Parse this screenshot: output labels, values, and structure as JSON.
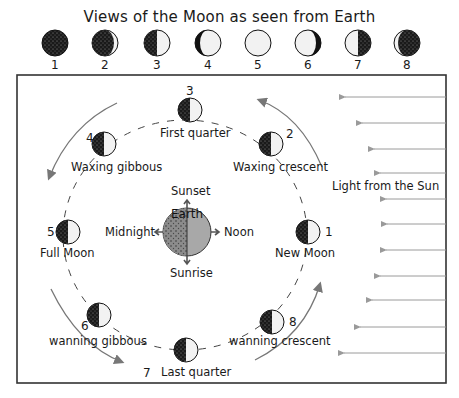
{
  "title": "Views of the Moon as seen from Earth",
  "views": [
    {
      "n": "1",
      "phase": "new"
    },
    {
      "n": "2",
      "phase": "waxing-crescent"
    },
    {
      "n": "3",
      "phase": "first-quarter"
    },
    {
      "n": "4",
      "phase": "waxing-gibbous"
    },
    {
      "n": "5",
      "phase": "full"
    },
    {
      "n": "6",
      "phase": "waning-gibbous"
    },
    {
      "n": "7",
      "phase": "last-quarter"
    },
    {
      "n": "8",
      "phase": "waning-crescent"
    }
  ],
  "orbit": {
    "positions": [
      {
        "n": "1",
        "label": "New Moon"
      },
      {
        "n": "2",
        "label": "Waxing crescent"
      },
      {
        "n": "3",
        "label": "First quarter"
      },
      {
        "n": "4",
        "label": "Waxing gibbous"
      },
      {
        "n": "5",
        "label": "Full Moon"
      },
      {
        "n": "6",
        "label": "wanning gibbous"
      },
      {
        "n": "7",
        "label": "Last quarter"
      },
      {
        "n": "8",
        "label": "wanning crescent"
      }
    ]
  },
  "earth": {
    "label": "Earth",
    "sunset": "Sunset",
    "sunrise": "Sunrise",
    "midnight": "Midnight",
    "noon": "Noon"
  },
  "sun": {
    "label": "Light from the Sun",
    "arrow_count": 11
  },
  "colors": {
    "dark": "#1a1a1a",
    "light": "#f2f2f2",
    "earth_day": "#a8a8a8",
    "arrow": "#9a9a9a",
    "frame": "#333333"
  }
}
